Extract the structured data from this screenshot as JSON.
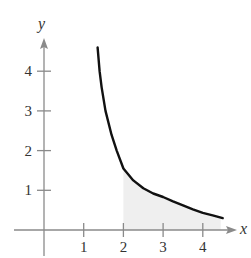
{
  "chart_data": {
    "type": "line",
    "title": "",
    "xlabel": "x",
    "ylabel": "y",
    "xlim": [
      0,
      4.8
    ],
    "ylim": [
      0,
      4.8
    ],
    "x_ticks": [
      1,
      2,
      3,
      4
    ],
    "y_ticks": [
      1,
      2,
      3,
      4
    ],
    "grid": false,
    "legend": null,
    "series": [
      {
        "name": "curve",
        "color": "#111111",
        "x": [
          1.35,
          1.4,
          1.45,
          1.55,
          1.7,
          1.83,
          2.0,
          2.25,
          2.5,
          2.75,
          3.0,
          3.25,
          3.5,
          3.75,
          4.0,
          4.25,
          4.5
        ],
        "y": [
          4.6,
          4.0,
          3.6,
          3.0,
          2.4,
          2.0,
          1.55,
          1.25,
          1.05,
          0.92,
          0.83,
          0.72,
          0.62,
          0.52,
          0.43,
          0.37,
          0.3
        ]
      }
    ],
    "shaded_region": {
      "description": "area under curve",
      "x_from": 2,
      "x_to": 4.45,
      "color": "#efefef"
    }
  },
  "axes": {
    "x_label": "x",
    "y_label": "y",
    "x_tick_labels": [
      "1",
      "2",
      "3",
      "4"
    ],
    "y_tick_labels": [
      "1",
      "2",
      "3",
      "4"
    ],
    "axis_color": "#8a8a8a"
  }
}
